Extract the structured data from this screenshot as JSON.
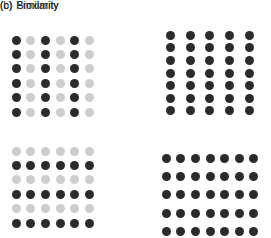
{
  "figure": {
    "background_color": "#ffffff",
    "dark_color": "#2b2b2b",
    "light_color": "#cdcdcd"
  },
  "panels": [
    {
      "id": "b",
      "tag": "(b)",
      "title": "Similarity",
      "grids": [
        {
          "id": "b-top",
          "columns": 6,
          "rows": 6,
          "dot_size": 9,
          "grouping": "column",
          "pattern": [
            [
              "dark",
              "light",
              "dark",
              "light",
              "dark",
              "light"
            ],
            [
              "dark",
              "light",
              "dark",
              "light",
              "dark",
              "light"
            ],
            [
              "dark",
              "light",
              "dark",
              "light",
              "dark",
              "light"
            ],
            [
              "dark",
              "light",
              "dark",
              "light",
              "dark",
              "light"
            ],
            [
              "dark",
              "light",
              "dark",
              "light",
              "dark",
              "light"
            ],
            [
              "dark",
              "light",
              "dark",
              "light",
              "dark",
              "light"
            ]
          ]
        },
        {
          "id": "b-bottom",
          "columns": 6,
          "rows": 6,
          "dot_size": 9,
          "grouping": "row",
          "pattern": [
            [
              "light",
              "light",
              "light",
              "light",
              "light",
              "light"
            ],
            [
              "dark",
              "dark",
              "dark",
              "dark",
              "dark",
              "dark"
            ],
            [
              "light",
              "light",
              "light",
              "light",
              "light",
              "light"
            ],
            [
              "dark",
              "dark",
              "dark",
              "dark",
              "dark",
              "dark"
            ],
            [
              "light",
              "light",
              "light",
              "light",
              "light",
              "light"
            ],
            [
              "dark",
              "dark",
              "dark",
              "dark",
              "dark",
              "dark"
            ]
          ]
        }
      ]
    },
    {
      "id": "c",
      "tag": "(c)",
      "title": "Proximity",
      "grids": [
        {
          "id": "c-top",
          "columns": 5,
          "rows": 7,
          "dot_size": 9,
          "grouping": "column",
          "pattern": [
            [
              "dark",
              "dark",
              "dark",
              "dark",
              "dark"
            ],
            [
              "dark",
              "dark",
              "dark",
              "dark",
              "dark"
            ],
            [
              "dark",
              "dark",
              "dark",
              "dark",
              "dark"
            ],
            [
              "dark",
              "dark",
              "dark",
              "dark",
              "dark"
            ],
            [
              "dark",
              "dark",
              "dark",
              "dark",
              "dark"
            ],
            [
              "dark",
              "dark",
              "dark",
              "dark",
              "dark"
            ],
            [
              "dark",
              "dark",
              "dark",
              "dark",
              "dark"
            ]
          ]
        },
        {
          "id": "c-bottom",
          "columns": 7,
          "rows": 5,
          "dot_size": 9,
          "grouping": "row",
          "pattern": [
            [
              "dark",
              "dark",
              "dark",
              "dark",
              "dark",
              "dark",
              "dark"
            ],
            [
              "dark",
              "dark",
              "dark",
              "dark",
              "dark",
              "dark",
              "dark"
            ],
            [
              "dark",
              "dark",
              "dark",
              "dark",
              "dark",
              "dark",
              "dark"
            ],
            [
              "dark",
              "dark",
              "dark",
              "dark",
              "dark",
              "dark",
              "dark"
            ],
            [
              "dark",
              "dark",
              "dark",
              "dark",
              "dark",
              "dark",
              "dark"
            ]
          ]
        }
      ]
    }
  ]
}
